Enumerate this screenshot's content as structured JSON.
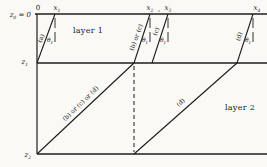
{
  "figure": {
    "background_color": "#faf9f6",
    "ink_color": "#1c1c1c"
  },
  "depth_labels": {
    "z0": {
      "base": "z",
      "sub": "0",
      "suffix": " = 0"
    },
    "z1": {
      "base": "z",
      "sub": "1"
    },
    "z2": {
      "base": "z",
      "sub": "2"
    }
  },
  "surface_labels": {
    "origin": "0",
    "x1": {
      "base": "x",
      "sub": "1"
    },
    "x2": {
      "base": "x",
      "sub": "2"
    },
    "comma": ",",
    "x3": {
      "base": "x",
      "sub": "3"
    },
    "x4": {
      "base": "x",
      "sub": "4"
    }
  },
  "layer_labels": {
    "layer1": "layer 1",
    "layer2": "layer 2"
  },
  "ray_labels": {
    "a": "(a)",
    "b_or_c": "(b) or (c)",
    "c": "(c)",
    "d_upper": "(d)",
    "b_or_c_or_d": "(b) or (c) or (d)",
    "d_lower": "(d)"
  },
  "angle_label": {
    "base": "θ",
    "sub": "1"
  }
}
